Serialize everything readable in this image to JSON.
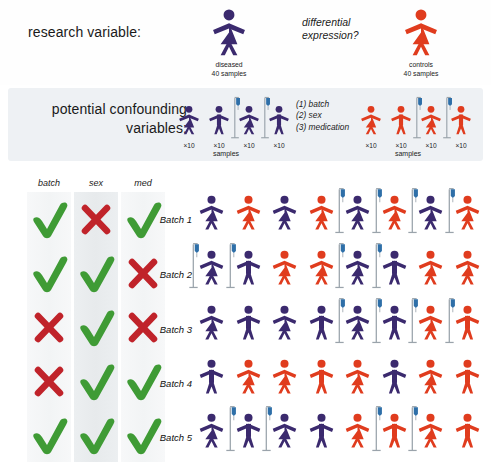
{
  "research_variable": {
    "label": "research variable:",
    "question": "differential expression?",
    "groups": [
      {
        "name": "diseased",
        "samples": "40 samples",
        "color": "#3b2a6e",
        "sex": "female",
        "key": "diseased"
      },
      {
        "name": "controls",
        "samples": "40 samples",
        "color": "#e03c1e",
        "sex": "female",
        "key": "controls"
      }
    ]
  },
  "confounders": {
    "label_line1": "potential confounding",
    "label_line2": "variables:",
    "items": [
      "(1) batch",
      "(2) sex",
      "(3) medication"
    ],
    "samples_label": "samples",
    "multiplier": "×10",
    "diseased_group": [
      {
        "color": "#3b2a6e",
        "sex": "female",
        "med": false,
        "count": "×10"
      },
      {
        "color": "#3b2a6e",
        "sex": "male",
        "med": false,
        "count": "×10"
      },
      {
        "color": "#3b2a6e",
        "sex": "female",
        "med": true,
        "count": "×10"
      },
      {
        "color": "#3b2a6e",
        "sex": "male",
        "med": true,
        "count": "×10"
      }
    ],
    "control_group": [
      {
        "color": "#e03c1e",
        "sex": "female",
        "med": false,
        "count": "×10"
      },
      {
        "color": "#e03c1e",
        "sex": "male",
        "med": false,
        "count": "×10"
      },
      {
        "color": "#e03c1e",
        "sex": "female",
        "med": true,
        "count": "×10"
      },
      {
        "color": "#e03c1e",
        "sex": "male",
        "med": true,
        "count": "×10"
      }
    ]
  },
  "matrix": {
    "columns": [
      "batch",
      "sex",
      "med"
    ],
    "check_color": "#3f9b35",
    "cross_color": "#c0232a",
    "rows": [
      {
        "batch": "check",
        "sex": "cross",
        "med": "check"
      },
      {
        "batch": "check",
        "sex": "check",
        "med": "cross"
      },
      {
        "batch": "cross",
        "sex": "check",
        "med": "cross"
      },
      {
        "batch": "cross",
        "sex": "check",
        "med": "check"
      },
      {
        "batch": "check",
        "sex": "check",
        "med": "check"
      }
    ]
  },
  "batches": [
    {
      "label": "Batch 1",
      "people": [
        {
          "color": "#3b2a6e",
          "sex": "female",
          "med": false
        },
        {
          "color": "#e03c1e",
          "sex": "female",
          "med": false
        },
        {
          "color": "#3b2a6e",
          "sex": "female",
          "med": false
        },
        {
          "color": "#e03c1e",
          "sex": "female",
          "med": false
        },
        {
          "color": "#3b2a6e",
          "sex": "female",
          "med": true
        },
        {
          "color": "#e03c1e",
          "sex": "female",
          "med": true
        },
        {
          "color": "#3b2a6e",
          "sex": "female",
          "med": true
        },
        {
          "color": "#e03c1e",
          "sex": "female",
          "med": true
        }
      ]
    },
    {
      "label": "Batch 2",
      "people": [
        {
          "color": "#3b2a6e",
          "sex": "female",
          "med": true
        },
        {
          "color": "#3b2a6e",
          "sex": "male",
          "med": true
        },
        {
          "color": "#e03c1e",
          "sex": "female",
          "med": false
        },
        {
          "color": "#e03c1e",
          "sex": "female",
          "med": false
        },
        {
          "color": "#3b2a6e",
          "sex": "female",
          "med": true
        },
        {
          "color": "#3b2a6e",
          "sex": "male",
          "med": true
        },
        {
          "color": "#e03c1e",
          "sex": "female",
          "med": false
        },
        {
          "color": "#e03c1e",
          "sex": "female",
          "med": false
        }
      ]
    },
    {
      "label": "Batch 3",
      "people": [
        {
          "color": "#3b2a6e",
          "sex": "female",
          "med": false
        },
        {
          "color": "#3b2a6e",
          "sex": "male",
          "med": false
        },
        {
          "color": "#3b2a6e",
          "sex": "female",
          "med": false
        },
        {
          "color": "#3b2a6e",
          "sex": "male",
          "med": false
        },
        {
          "color": "#3b2a6e",
          "sex": "female",
          "med": true
        },
        {
          "color": "#3b2a6e",
          "sex": "male",
          "med": true
        },
        {
          "color": "#e03c1e",
          "sex": "female",
          "med": true
        },
        {
          "color": "#e03c1e",
          "sex": "male",
          "med": true
        }
      ]
    },
    {
      "label": "Batch 4",
      "people": [
        {
          "color": "#3b2a6e",
          "sex": "male",
          "med": false
        },
        {
          "color": "#e03c1e",
          "sex": "female",
          "med": false
        },
        {
          "color": "#e03c1e",
          "sex": "female",
          "med": false
        },
        {
          "color": "#e03c1e",
          "sex": "male",
          "med": false
        },
        {
          "color": "#e03c1e",
          "sex": "female",
          "med": false
        },
        {
          "color": "#3b2a6e",
          "sex": "male",
          "med": false
        },
        {
          "color": "#e03c1e",
          "sex": "female",
          "med": false
        },
        {
          "color": "#e03c1e",
          "sex": "male",
          "med": false
        }
      ]
    },
    {
      "label": "Batch 5",
      "people": [
        {
          "color": "#3b2a6e",
          "sex": "female",
          "med": false
        },
        {
          "color": "#3b2a6e",
          "sex": "male",
          "med": true
        },
        {
          "color": "#3b2a6e",
          "sex": "female",
          "med": true
        },
        {
          "color": "#3b2a6e",
          "sex": "male",
          "med": false
        },
        {
          "color": "#e03c1e",
          "sex": "female",
          "med": false
        },
        {
          "color": "#e03c1e",
          "sex": "male",
          "med": true
        },
        {
          "color": "#e03c1e",
          "sex": "female",
          "med": true
        },
        {
          "color": "#e03c1e",
          "sex": "male",
          "med": false
        }
      ]
    }
  ],
  "colors": {
    "diseased_purple": "#3b2a6e",
    "control_red": "#e03c1e",
    "iv_pole": "#9aa3ab",
    "iv_bag": "#2e6fa8",
    "band_bg": "#eef1f4"
  }
}
